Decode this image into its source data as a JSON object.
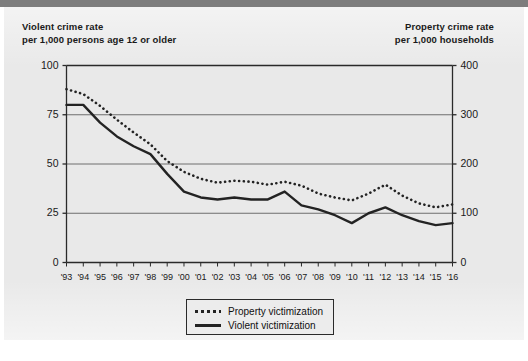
{
  "figure": {
    "background_color": "#e9e9e9",
    "page_color": "#ffffff",
    "accent_color": "#232323"
  },
  "chart_data": {
    "type": "line",
    "title": "",
    "subtitle": "",
    "xlabel": "",
    "ylabel": "Violent crime rate per 1,000 persons age 12 or older",
    "y2label": "Property crime rate per 1,000 households",
    "grid": true,
    "legend_position": "bottom-center",
    "left_axis_title_line1": "Violent crime rate",
    "left_axis_title_line2": "per 1,000 persons age 12 or older",
    "right_axis_title_line1": "Property crime rate",
    "right_axis_title_line2": "per 1,000 households",
    "x": [
      "'93",
      "'94",
      "'95",
      "'96",
      "'97",
      "'98",
      "'99",
      "'00",
      "'01",
      "'02",
      "'03",
      "'04",
      "'05",
      "'06",
      "'07",
      "'08",
      "'09",
      "'10",
      "'11",
      "'12",
      "'13",
      "'14",
      "'15",
      "'16"
    ],
    "ylim": [
      0,
      100
    ],
    "yticks": [
      0,
      25,
      50,
      75,
      100
    ],
    "y2lim": [
      0,
      400
    ],
    "y2ticks": [
      0,
      100,
      200,
      300,
      400
    ],
    "series": [
      {
        "name": "Property victimization",
        "axis": "right",
        "style": "dotted",
        "color": "#232323",
        "values": [
          352,
          342,
          318,
          290,
          264,
          240,
          206,
          184,
          170,
          162,
          166,
          164,
          158,
          164,
          156,
          140,
          132,
          126,
          140,
          158,
          136,
          120,
          112,
          118
        ]
      },
      {
        "name": "Violent victimization",
        "axis": "left",
        "style": "solid",
        "color": "#232323",
        "values": [
          80,
          80,
          71,
          64,
          59,
          55,
          45,
          36,
          33,
          32,
          33,
          32,
          32,
          36,
          29,
          27,
          24,
          20,
          25,
          28,
          24,
          21,
          19,
          20
        ]
      }
    ],
    "legend": [
      {
        "label": "Property victimization",
        "style": "dotted"
      },
      {
        "label": "Violent victimization",
        "style": "solid"
      }
    ]
  }
}
